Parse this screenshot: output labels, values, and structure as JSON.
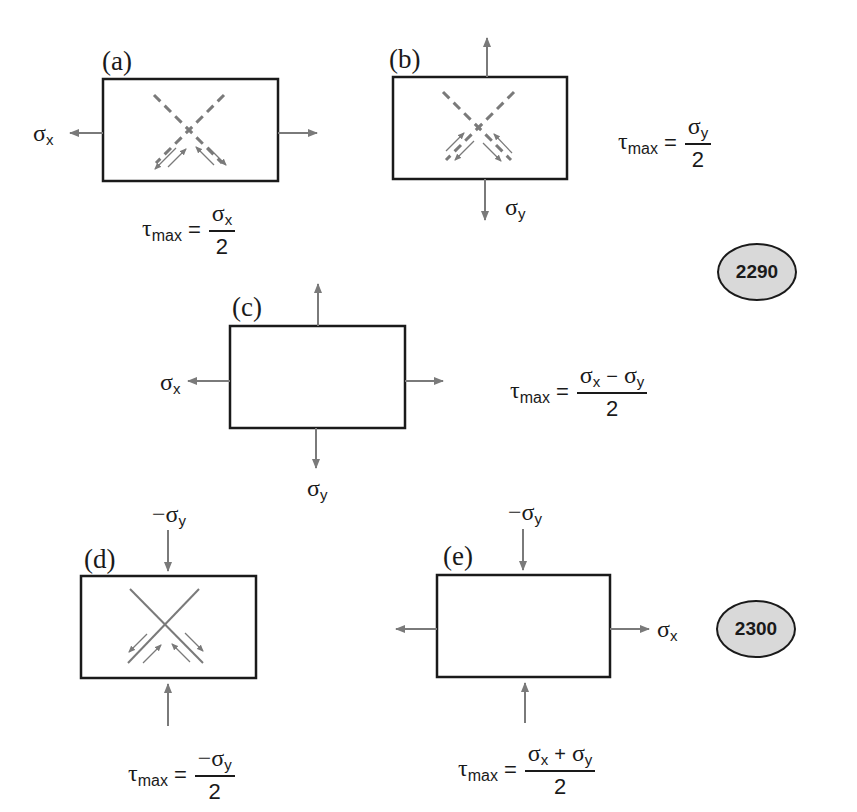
{
  "colors": {
    "box_stroke": "#1a1a1a",
    "arrow": "#7a7a7a",
    "badge_fill": "#d9d9d9"
  },
  "panels": [
    {
      "label": "(a)",
      "loads": {
        "left": "σx",
        "right": ""
      },
      "plane_lines": "dashed",
      "equation": {
        "lhs": "τ",
        "lhs_sub": "max",
        "equals": "=",
        "numerator": "σx",
        "denominator": "2"
      }
    },
    {
      "label": "(b)",
      "loads": {
        "bottom": "σy",
        "top": ""
      },
      "plane_lines": "dashed",
      "equation": {
        "lhs": "τ",
        "lhs_sub": "max",
        "equals": "=",
        "numerator": "σy",
        "denominator": "2"
      }
    },
    {
      "label": "(c)",
      "loads": {
        "left": "σx",
        "bottom": "σy"
      },
      "plane_lines": "none",
      "equation": {
        "lhs": "τ",
        "lhs_sub": "max",
        "equals": "=",
        "numerator": "σx − σy",
        "denominator": "2"
      }
    },
    {
      "label": "(d)",
      "loads": {
        "top": "−σy",
        "bottom": ""
      },
      "plane_lines": "solid",
      "equation": {
        "lhs": "τ",
        "lhs_sub": "max",
        "equals": "=",
        "numerator": "−σy",
        "denominator": "2"
      }
    },
    {
      "label": "(e)",
      "loads": {
        "top": "−σy",
        "right": "σx"
      },
      "plane_lines": "none",
      "equation": {
        "lhs": "τ",
        "lhs_sub": "max",
        "equals": "=",
        "numerator": "σx + σy",
        "denominator": "2"
      }
    }
  ],
  "symbols": {
    "sigma": "σ",
    "minus_sigma": "−σ",
    "x": "x",
    "y": "y",
    "tau": "τ",
    "max": "max",
    "equals": "=",
    "two": "2",
    "minus": "−",
    "plus": "+"
  },
  "badges": [
    {
      "label": "2290"
    },
    {
      "label": "2300"
    }
  ]
}
